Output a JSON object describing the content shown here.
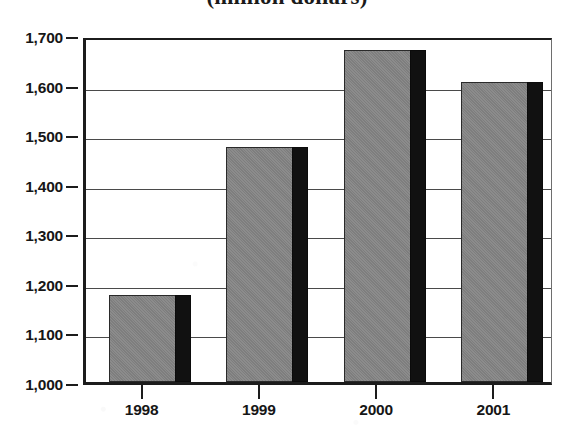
{
  "chart_data": {
    "type": "bar",
    "title": "(million dollars)",
    "xlabel": "",
    "ylabel": "",
    "categories": [
      "1998",
      "1999",
      "2000",
      "2001"
    ],
    "values": [
      1175,
      1475,
      1670,
      1605
    ],
    "ylim": [
      1000,
      1700
    ],
    "yticks": [
      1700,
      1600,
      1500,
      1400,
      1300,
      1200,
      1100,
      1000
    ],
    "ytick_labels": [
      "1,700",
      "1,600",
      "1,500",
      "1,400",
      "1,300",
      "1,200",
      "1,100",
      "1,000"
    ],
    "grid": true,
    "legend": false,
    "legend_position": "none",
    "series": [
      {
        "name": "",
        "values": [
          1175,
          1475,
          1670,
          1605
        ]
      }
    ],
    "colors": {
      "bar_fill": "#858585",
      "bar_shadow": "#111111",
      "bar_outline": "#2a2a2a",
      "gridline": "#4a4a4a",
      "axis": "#1c1c1c",
      "text": "#161616",
      "background": "#ffffff"
    },
    "annotations": []
  }
}
